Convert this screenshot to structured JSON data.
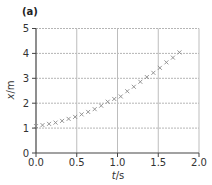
{
  "chart_data": {
    "type": "scatter",
    "panel_label": "(a)",
    "title": "",
    "xlabel": "t/s",
    "ylabel": "x/m",
    "xlim": [
      0.0,
      2.0
    ],
    "ylim": [
      0,
      5
    ],
    "xticks": [
      "0.0",
      "0.5",
      "1.0",
      "1.5",
      "2.0"
    ],
    "yticks": [
      "0",
      "1",
      "2",
      "3",
      "4",
      "5"
    ],
    "grid": true,
    "marker": "x",
    "marker_color": "#8a8a8a",
    "series": [
      {
        "name": "x vs t",
        "x": [
          0.0,
          0.08,
          0.16,
          0.24,
          0.32,
          0.4,
          0.48,
          0.56,
          0.64,
          0.72,
          0.8,
          0.88,
          0.96,
          1.04,
          1.12,
          1.2,
          1.28,
          1.36,
          1.44,
          1.52,
          1.6,
          1.68,
          1.76
        ],
        "y": [
          1.08,
          1.12,
          1.17,
          1.22,
          1.29,
          1.37,
          1.45,
          1.55,
          1.65,
          1.76,
          1.9,
          2.06,
          2.17,
          2.27,
          2.48,
          2.66,
          2.86,
          3.05,
          3.22,
          3.42,
          3.64,
          3.83,
          4.04
        ]
      }
    ]
  }
}
